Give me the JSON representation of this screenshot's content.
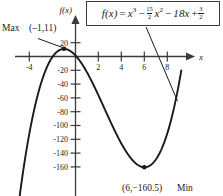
{
  "figure": {
    "equation_box": {
      "f_name": "f",
      "arg": "(x)",
      "equals": "=",
      "term1_base": "x",
      "term1_exp": "3",
      "minus1": "−",
      "coef_num": "15",
      "coef_den": "2",
      "term2_base": "x",
      "term2_exp": "2",
      "minus2": "−",
      "term3": "18x",
      "plus": "+",
      "const_num": "3",
      "const_den": "2",
      "full_text": "f(x) = x^3 - (15/2)x^2 - 18x + 3/2"
    },
    "y_axis_name": "f(x)",
    "x_axis_name": "x",
    "max_label": {
      "word": "Max",
      "point": "(–1,11)"
    },
    "min_label": {
      "point": "(6,−160.5)",
      "word": "Min"
    }
  },
  "chart_data": {
    "type": "line",
    "title": "",
    "subtitle": "",
    "xlabel": "x",
    "ylabel": "f(x)",
    "function": "f(x) = x^3 - (15/2)x^2 - 18x + 3/2",
    "grid": false,
    "legend": null,
    "xlim": [
      -4.9,
      9.2
    ],
    "ylim": [
      -180,
      30
    ],
    "x_ticks": [
      -4,
      2,
      4,
      6,
      8
    ],
    "x_tick_labels": [
      "-4",
      "2",
      "4",
      "6",
      "8"
    ],
    "y_ticks": [
      20,
      -20,
      -40,
      -60,
      -80,
      -100,
      -120,
      -140,
      -160
    ],
    "y_tick_labels": [
      "20",
      "-20",
      "-40",
      "-60",
      "-80",
      "-100",
      "-120",
      "-140",
      "-160"
    ],
    "series": [
      {
        "name": "f(x) = x^3 - (15/2)x^2 - 18x + 3/2",
        "x": [
          -4.85,
          -4.5,
          -4,
          -3.5,
          -3,
          -2.5,
          -2,
          -1.5,
          -1,
          -0.5,
          0,
          0.5,
          1,
          1.5,
          2,
          2.5,
          3,
          3.5,
          4,
          4.5,
          5,
          5.5,
          6,
          6.5,
          7,
          7.5,
          8,
          8.5,
          8.9
        ],
        "y": [
          -202.7,
          -160.1,
          -110.5,
          -69.5,
          -36.5,
          -10.9,
          8.5,
          21.8,
          29.5,
          31.9,
          29.5,
          22.8,
          22.8,
          22.8,
          22.8,
          22.8,
          22.8,
          22.8,
          22.8,
          22.8,
          22.8,
          22.8,
          22.8,
          22.8,
          22.8,
          22.8,
          22.8,
          22.8,
          22.8
        ]
      }
    ],
    "annotations": [
      {
        "name": "maximum-point",
        "label": "Max (–1,11)",
        "x": -1,
        "y": 11,
        "marker": "filled-dot"
      },
      {
        "name": "minimum-point",
        "label": "(6,−160.5) Min",
        "x": 6,
        "y": -160.5,
        "marker": "filled-dot"
      },
      {
        "name": "equation-callout-leader",
        "label": "leader line from equation box to curve",
        "x": 8.5,
        "y": -47
      }
    ],
    "colors": {
      "curve": "#1a1a1a",
      "axis": "#3b3b3b",
      "background": "#ffffff",
      "text": "#1a1a1a"
    }
  }
}
